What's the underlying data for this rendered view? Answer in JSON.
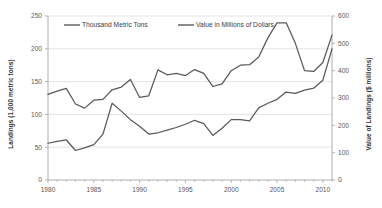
{
  "chart_data": {
    "type": "line",
    "title": "",
    "xlabel": "",
    "ylabel": "Landings (1,000 metric tons)",
    "y2label": "Value of Landings ($ millions)",
    "grid": true,
    "legend_position": "top-inside",
    "xlim": [
      1980,
      2011
    ],
    "ylim": [
      0,
      250
    ],
    "y2lim": [
      0,
      600
    ],
    "x": [
      1980,
      1981,
      1982,
      1983,
      1984,
      1985,
      1986,
      1987,
      1988,
      1989,
      1990,
      1991,
      1992,
      1993,
      1994,
      1995,
      1996,
      1997,
      1998,
      1999,
      2000,
      2001,
      2002,
      2003,
      2004,
      2005,
      2006,
      2007,
      2008,
      2009,
      2010,
      2011
    ],
    "xticklabels": [
      "1980",
      "1985",
      "1990",
      "1995",
      "2000",
      "2005",
      "2010"
    ],
    "xtickvalues": [
      1980,
      1985,
      1990,
      1995,
      2000,
      2005,
      2010
    ],
    "yticklabels": [
      "0",
      "50",
      "100",
      "150",
      "200",
      "250"
    ],
    "ytickvalues": [
      0,
      50,
      100,
      150,
      200,
      250
    ],
    "y2ticklabels": [
      "0",
      "100",
      "200",
      "300",
      "400",
      "500",
      "600"
    ],
    "y2tickvalues": [
      0,
      100,
      200,
      300,
      400,
      500,
      600
    ],
    "series": [
      {
        "name": "Thousand Metric Tons",
        "axis": "left",
        "color": "#595959",
        "values": [
          56,
          59,
          61,
          45,
          49,
          54,
          70,
          117,
          105,
          92,
          82,
          70,
          72,
          76,
          80,
          85,
          91,
          86,
          68,
          79,
          92,
          92,
          90,
          110,
          117,
          123,
          134,
          132,
          137,
          140,
          152,
          200
        ]
      },
      {
        "name": "Value in Millions of Dollars",
        "axis": "right",
        "color": "#595959",
        "values": [
          313,
          325,
          335,
          278,
          263,
          292,
          295,
          330,
          340,
          368,
          302,
          308,
          403,
          385,
          390,
          382,
          404,
          390,
          342,
          352,
          400,
          420,
          422,
          450,
          520,
          575,
          575,
          500,
          400,
          397,
          430,
          530
        ]
      }
    ],
    "legend": [
      {
        "label": "Thousand Metric Tons",
        "color": "#595959"
      },
      {
        "label": "Value in Millions of Dollars",
        "color": "#595959"
      }
    ]
  },
  "axes": {
    "left_title": "Landings (1,000 metric tons)",
    "right_title": "Value of Landings ($ millions)"
  }
}
